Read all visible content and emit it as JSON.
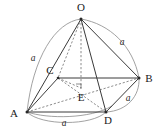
{
  "figure": {
    "kind": "solid-geometry-diagram",
    "vertices": [
      {
        "name": "O",
        "label": "O",
        "x": 81,
        "y": 19,
        "label_x": 81,
        "label_y": 11,
        "role": "apex"
      },
      {
        "name": "B",
        "label": "B",
        "x": 139,
        "y": 78,
        "label_x": 149,
        "label_y": 82,
        "role": "base-corner"
      },
      {
        "name": "C",
        "label": "C",
        "x": 58,
        "y": 78,
        "label_x": 50,
        "label_y": 74,
        "role": "base-corner"
      },
      {
        "name": "A",
        "label": "A",
        "x": 27,
        "y": 112,
        "label_x": 14,
        "label_y": 117,
        "role": "base-corner"
      },
      {
        "name": "D",
        "label": "D",
        "x": 106,
        "y": 112,
        "label_x": 108,
        "label_y": 124,
        "role": "base-corner"
      },
      {
        "name": "E",
        "label": "E",
        "x": 81,
        "y": 88,
        "label_x": 81,
        "label_y": 101,
        "role": "base-center"
      }
    ],
    "edge_labels": [
      {
        "name": "edge-label-oa",
        "text": "a",
        "x": 33,
        "y": 61,
        "edge": "O-A"
      },
      {
        "name": "edge-label-ob",
        "text": "a",
        "x": 122,
        "y": 45,
        "edge": "O-B"
      },
      {
        "name": "edge-label-bd",
        "text": "a",
        "x": 128,
        "y": 101,
        "edge": "B-D"
      },
      {
        "name": "edge-label-ad",
        "text": "a",
        "x": 64,
        "y": 126,
        "edge": "A-D"
      }
    ],
    "solid_edges": [
      {
        "name": "edge-oa",
        "from": "O",
        "to": "A"
      },
      {
        "name": "edge-ob",
        "from": "O",
        "to": "B"
      },
      {
        "name": "edge-od",
        "from": "O",
        "to": "D"
      },
      {
        "name": "edge-cb",
        "from": "C",
        "to": "B"
      },
      {
        "name": "edge-ac",
        "from": "A",
        "to": "C"
      },
      {
        "name": "edge-ad",
        "from": "A",
        "to": "D"
      },
      {
        "name": "edge-db",
        "from": "D",
        "to": "B"
      }
    ],
    "dashed_edges": [
      {
        "name": "edge-oc",
        "from": "O",
        "to": "C"
      },
      {
        "name": "edge-oe",
        "from": "O",
        "to": "E"
      },
      {
        "name": "edge-cd",
        "from": "C",
        "to": "D"
      },
      {
        "name": "edge-ab",
        "from": "A",
        "to": "B"
      }
    ],
    "arcs": [
      {
        "name": "arc-oa",
        "from": "O",
        "to": "A",
        "bulge": "left"
      },
      {
        "name": "arc-ob",
        "from": "O",
        "to": "B",
        "bulge": "right"
      },
      {
        "name": "arc-bd",
        "from": "B",
        "to": "D",
        "bulge": "right"
      },
      {
        "name": "arc-ad",
        "from": "A",
        "to": "D",
        "bulge": "bottom"
      },
      {
        "name": "arc-ac-back",
        "from": "A",
        "to": "B",
        "bulge": "lower"
      }
    ],
    "right_angle_marker": {
      "name": "right-angle-at-e",
      "x": 78,
      "y": 84,
      "size": 5
    },
    "colors": {
      "background": "#ffffff",
      "solid_edge": "#3a3a3a",
      "dashed_edge": "#6e6e6e",
      "arc": "#8a8a8a",
      "label": "#1a1a1a"
    }
  }
}
